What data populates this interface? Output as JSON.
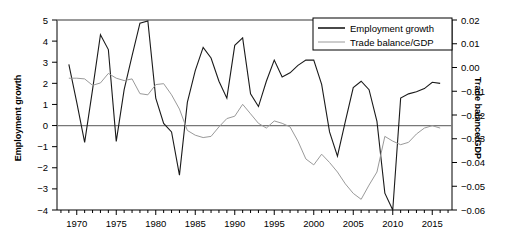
{
  "chart_data": {
    "type": "line",
    "title": "",
    "xlabel": "",
    "ylabel": "Employment growth",
    "y2label": "Trade balance/GDP",
    "xlim": [
      1967.5,
      2017.5
    ],
    "ylim": [
      -4,
      5
    ],
    "y2lim": [
      -0.06,
      0.02
    ],
    "grid": false,
    "zero_line": true,
    "legend_position": "top-right",
    "xticks": [
      1970,
      1975,
      1980,
      1985,
      1990,
      1995,
      2000,
      2005,
      2010,
      2015
    ],
    "xticklabels": [
      "1970",
      "1975",
      "1980",
      "1985",
      "1990",
      "1995",
      "2000",
      "2005",
      "2010",
      "2015"
    ],
    "xminor_step": 1,
    "yticks": [
      -4,
      -3,
      -2,
      -1,
      0,
      1,
      2,
      3,
      4,
      5
    ],
    "yticklabels": [
      "−4",
      "−3",
      "−2",
      "−1",
      "0",
      "1",
      "2",
      "3",
      "4",
      "5"
    ],
    "y2ticks": [
      -0.06,
      -0.05,
      -0.04,
      -0.03,
      -0.02,
      -0.01,
      0.0,
      0.01,
      0.02
    ],
    "y2ticklabels": [
      "−0.06",
      "−0.05",
      "−0.04",
      "−0.03",
      "−0.02",
      "−0.01",
      "0.00",
      "0.01",
      "0.02"
    ],
    "x": [
      1969,
      1970,
      1971,
      1972,
      1973,
      1974,
      1975,
      1976,
      1977,
      1978,
      1979,
      1980,
      1981,
      1982,
      1983,
      1984,
      1985,
      1986,
      1987,
      1988,
      1989,
      1990,
      1991,
      1992,
      1993,
      1994,
      1995,
      1996,
      1997,
      1998,
      1999,
      2000,
      2001,
      2002,
      2003,
      2004,
      2005,
      2006,
      2007,
      2008,
      2009,
      2010,
      2011,
      2012,
      2013,
      2014,
      2015,
      2016
    ],
    "series": [
      {
        "name": "Employment growth",
        "axis": "left",
        "color": "#1a1a1a",
        "linewidth": 1.1,
        "values": [
          2.9,
          1.1,
          -0.8,
          1.7,
          4.3,
          3.6,
          -0.75,
          1.7,
          3.3,
          4.85,
          4.95,
          1.3,
          0.1,
          -0.3,
          -2.35,
          1.1,
          2.6,
          3.7,
          3.2,
          2.1,
          1.3,
          3.8,
          4.15,
          1.5,
          0.9,
          2.1,
          3.1,
          2.3,
          2.5,
          2.85,
          3.1,
          3.1,
          1.95,
          -0.3,
          -1.45,
          0.2,
          1.8,
          2.1,
          1.7,
          0.2,
          -3.2,
          -4.0,
          1.3,
          1.5,
          1.6,
          1.75,
          2.05,
          2.0
        ]
      },
      {
        "name": "Trade balance/GDP",
        "axis": "right",
        "color": "#9a9a9a",
        "linewidth": 1.0,
        "values": [
          -0.0045,
          -0.0045,
          -0.0048,
          -0.0075,
          -0.0065,
          -0.0025,
          -0.0045,
          -0.0055,
          -0.0048,
          -0.011,
          -0.0115,
          -0.0072,
          -0.0068,
          -0.0115,
          -0.0175,
          -0.0265,
          -0.0285,
          -0.0295,
          -0.029,
          -0.025,
          -0.0215,
          -0.0205,
          -0.0155,
          -0.0195,
          -0.0235,
          -0.0255,
          -0.0225,
          -0.0235,
          -0.025,
          -0.031,
          -0.0385,
          -0.041,
          -0.0365,
          -0.04,
          -0.044,
          -0.049,
          -0.053,
          -0.0555,
          -0.0495,
          -0.044,
          -0.029,
          -0.031,
          -0.0325,
          -0.0315,
          -0.028,
          -0.0255,
          -0.0245,
          -0.0255
        ]
      }
    ]
  },
  "legend": {
    "items": [
      {
        "label": "Employment growth",
        "color": "#1a1a1a"
      },
      {
        "label": "Trade balance/GDP",
        "color": "#9a9a9a"
      }
    ]
  }
}
